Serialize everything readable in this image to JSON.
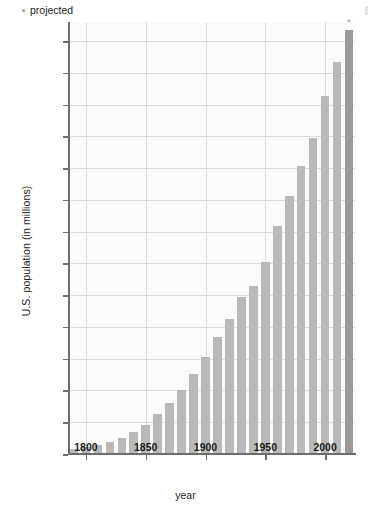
{
  "chart_data": {
    "type": "bar",
    "title": "",
    "xlabel": "year",
    "ylabel": "U.S. population (in millions)",
    "xlim": [
      1785,
      2025
    ],
    "ylim": [
      0,
      340
    ],
    "grid": true,
    "legend_position": "top-left",
    "legend": [
      {
        "label": "projected",
        "marker": "asterisk",
        "color": "#9a9a9a"
      }
    ],
    "bar_color": "#b9b9b9",
    "projected_bar_color": "#9a9a9a",
    "ytick_labels": [
      "0",
      "25",
      "50",
      "75",
      "100",
      "125",
      "150",
      "175",
      "200",
      "225",
      "250",
      "275",
      "300",
      "325"
    ],
    "yticks": [
      0,
      25,
      50,
      75,
      100,
      125,
      150,
      175,
      200,
      225,
      250,
      275,
      300,
      325
    ],
    "xtick_labels": [
      "1800",
      "1850",
      "1900",
      "1950",
      "2000"
    ],
    "xticks": [
      1800,
      1850,
      1900,
      1950,
      2000
    ],
    "categories": [
      1790,
      1800,
      1810,
      1820,
      1830,
      1840,
      1850,
      1860,
      1870,
      1880,
      1890,
      1900,
      1910,
      1920,
      1930,
      1940,
      1950,
      1960,
      1970,
      1980,
      1990,
      2000,
      2010,
      2020
    ],
    "values": [
      3.9,
      5.3,
      7.2,
      9.6,
      12.9,
      17.1,
      23.2,
      31.4,
      39.8,
      50.2,
      62.9,
      76.2,
      92.2,
      106.0,
      123.2,
      132.2,
      151.3,
      179.3,
      203.3,
      226.5,
      248.7,
      281.4,
      308.7,
      334.0
    ],
    "projected_flags": [
      false,
      false,
      false,
      false,
      false,
      false,
      false,
      false,
      false,
      false,
      false,
      false,
      false,
      false,
      false,
      false,
      false,
      false,
      false,
      false,
      false,
      false,
      false,
      true
    ],
    "annotations": [
      {
        "x": 2020,
        "text": "*",
        "note": "asterisk above projected bar"
      }
    ]
  }
}
